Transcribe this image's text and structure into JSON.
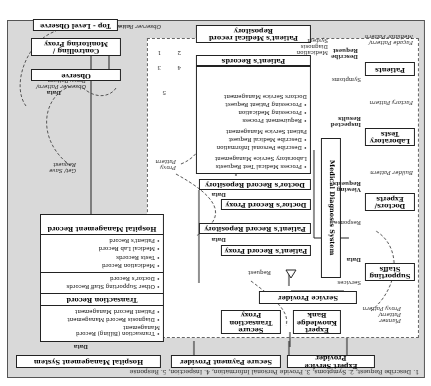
{
  "caption": "1. Describe Request, 2. Symptoms, 3. Provide Personal Information, 4. Inspection, 5. Response",
  "top_boxes": {
    "hospital_management_system": "Hospital Management System",
    "secure_payment_provider": "Secure Payment Provider",
    "expert_service_provider": "Expert Service Provider"
  },
  "hmr": {
    "title": "Hospital Management Record",
    "records": [
      "Patient's Record",
      "Medical Lab Record",
      "Tests Records",
      "Medication Record",
      "Doctor's Record",
      "Other Supporting Staff Records"
    ],
    "transaction_title": "Transaction Record",
    "transaction_items": [
      "Patient Record Management",
      "Diagnosis Record Management",
      "Transaction (Billing) Record Management"
    ]
  },
  "mid_boxes": {
    "secure_transaction_proxy": "Secure Transaction Proxy",
    "expert_knowledge_bank": "Expert Knowledge Bank",
    "service_provider": "Service Provider",
    "patients_record_proxy": "Patient's Record Proxy",
    "patients_record_repository": "Patient's Record Repository",
    "doctors_record_proxy": "Doctor's Record Proxy",
    "doctors_record_repository": "Doctor's Record Repository",
    "medical_diagnosis_system": "Medical Diagnosis System",
    "patients_records": "Patient's Records",
    "patients_medical_record_repository": "Patient's Medical record Repository"
  },
  "services": {
    "lab_title": "Laboratory Service Management",
    "lab_items": [
      "Process Medical Test Requests"
    ],
    "patient_title": "Patient Service Management",
    "patient_items": [
      "Describe Medical Request",
      "Describe Personal Information"
    ],
    "doctor_title": "Doctors Service Management",
    "doctor_items": [
      "Processing Patient Request",
      "Processing Medication",
      "Requirement Process"
    ]
  },
  "right_boxes": {
    "supporting_staffs": "Supporting Staffs",
    "doctors_experts": "Doctors/ Experts",
    "laboratory_tests": "Laboratory Tests",
    "patients": "Patients"
  },
  "left_boxes": {
    "observe": "Observe",
    "controlling_proxy": "Controlling / Monitoring Proxy",
    "top_level_observe": "Top - Level Observe"
  },
  "labels": {
    "data": "Data",
    "request": "Request",
    "get_save_request": "Get/ Save Request",
    "proxy_pattern": "Proxy Pattern",
    "planner_pattern": "Planner Pattern/ Proxy Pattern",
    "builder_pattern": "Builder Pattern",
    "factory_pattern": "Factory Pattern",
    "facade_pattern": "Façade Pattern/ Mediator Pattern",
    "observer_pattern": "Observer Pattern",
    "observer_proxy_pattern": "Observer Pattern/ Proxy Pattern",
    "services": "Services",
    "response": "Response",
    "viewing_requests": "Viewing Requests",
    "inspected_results": "Inspected Results",
    "symptoms": "Symptoms",
    "describe_request": "Describe Request",
    "medication_diagnosis_system": "Medication Diagnosis System",
    "n1": "1",
    "n2": "2",
    "n3": "3",
    "n4": "4",
    "n5": "5"
  }
}
